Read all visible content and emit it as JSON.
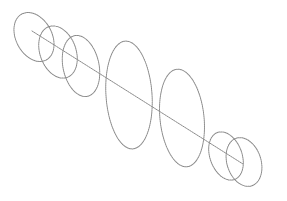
{
  "diagram": {
    "colors": {
      "background": "#ffffff",
      "stroke": "#8a8a8a"
    },
    "axis": {
      "x1": 32,
      "y1": 31,
      "x2": 243,
      "y2": 164
    },
    "rings": [
      {
        "cx": 34,
        "cy": 37,
        "rx": 18,
        "ry": 26,
        "rotate": 28
      },
      {
        "cx": 58,
        "cy": 52,
        "rx": 18,
        "ry": 27,
        "rotate": 20
      },
      {
        "cx": 81,
        "cy": 66,
        "rx": 18,
        "ry": 31,
        "rotate": 12
      },
      {
        "cx": 129,
        "cy": 95,
        "rx": 23,
        "ry": 54,
        "rotate": 4
      },
      {
        "cx": 182,
        "cy": 118,
        "rx": 22,
        "ry": 49,
        "rotate": 6
      },
      {
        "cx": 226,
        "cy": 156,
        "rx": 16,
        "ry": 25,
        "rotate": 20
      },
      {
        "cx": 244,
        "cy": 162,
        "rx": 17,
        "ry": 25,
        "rotate": 18
      }
    ]
  }
}
